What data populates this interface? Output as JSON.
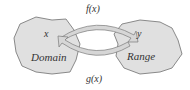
{
  "diagram": {
    "domain": {
      "name": "Domain",
      "variable": "x"
    },
    "range": {
      "name": "Range",
      "variable": "y"
    },
    "forward_map": {
      "label": "f(x)",
      "from": "x",
      "to": "y"
    },
    "inverse_map": {
      "label": "g(x)",
      "from": "y",
      "to": "x"
    },
    "colors": {
      "blob_fill": "#e0e0e0",
      "blob_stroke": "#6e6e6e",
      "arrow_fill": "#d6d6d6",
      "arrow_stroke": "#7a7a7a",
      "text": "#333333"
    }
  }
}
